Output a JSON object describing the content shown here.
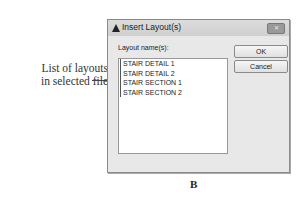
{
  "callout": {
    "line1": "List of layouts",
    "line2": "in selected file"
  },
  "dialog": {
    "title": "Insert Layout(s)",
    "title_icon": "autocad-logo-icon",
    "close_label": "✕",
    "list_label": "Layout name(s):",
    "layouts": [
      "STAIR DETAIL 1",
      "STAIR DETAIL 2",
      "STAIR SECTION 1",
      "STAIR SECTION 2"
    ],
    "buttons": {
      "ok": "OK",
      "cancel": "Cancel"
    }
  },
  "figure_label": "B"
}
